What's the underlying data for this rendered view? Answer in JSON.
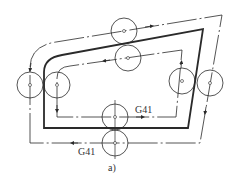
{
  "diagram": {
    "caption": "a)",
    "labels": {
      "inner_path_code": "G41",
      "outer_path_code": "G41"
    },
    "colors": {
      "stroke": "#2a2a2a",
      "background": "#ffffff"
    },
    "elements": {
      "workpiece_contour": "bold closed contour (part profile)",
      "outer_tool_path": "dash-dot tool center path (outside contour)",
      "inner_tool_path": "dash-dot tool center path (inside contour)",
      "tool_circles": 8
    }
  }
}
